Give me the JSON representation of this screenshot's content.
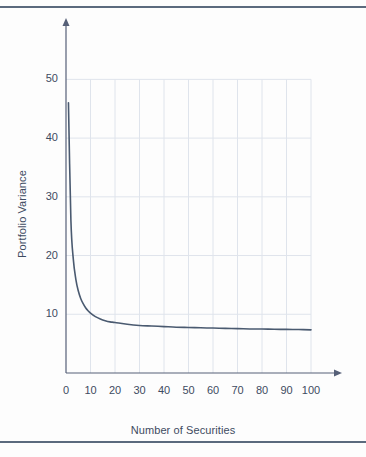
{
  "figure": {
    "background_color": "#fdfdfd",
    "rule_color": "#5b6a7d",
    "frame": {
      "top_rule": true,
      "bottom_rule": true
    }
  },
  "axes": {
    "x": {
      "title": "Number of Securities",
      "ticks": [
        "0",
        "10",
        "20",
        "30",
        "40",
        "50",
        "60",
        "70",
        "80",
        "90",
        "100"
      ],
      "range": [
        0,
        100
      ],
      "arrow": true
    },
    "y": {
      "title": "Portfolio Variance",
      "ticks": [
        "10",
        "20",
        "30",
        "40",
        "50"
      ],
      "range": [
        0,
        55
      ],
      "arrow": true
    }
  },
  "style": {
    "curve_color": "#4a5a70",
    "grid_color": "#dfe4ec",
    "axis_color": "#566078",
    "label_color": "#3d4b61"
  },
  "chart_data": {
    "type": "line",
    "title": "",
    "xlabel": "Number of Securities",
    "ylabel": "Portfolio Variance",
    "xlim": [
      0,
      100
    ],
    "ylim": [
      0,
      55
    ],
    "grid": true,
    "legend": "none",
    "x": [
      1,
      2,
      3,
      4,
      5,
      6,
      7,
      8,
      9,
      10,
      12,
      14,
      16,
      18,
      20,
      25,
      30,
      35,
      40,
      45,
      50,
      55,
      60,
      65,
      70,
      75,
      80,
      85,
      90,
      95,
      100
    ],
    "series": [
      {
        "name": "Portfolio Variance",
        "values": [
          46.0,
          26.0,
          19.3,
          16.0,
          14.0,
          12.7,
          11.8,
          11.1,
          10.6,
          10.2,
          9.6,
          9.2,
          8.9,
          8.7,
          8.6,
          8.3,
          8.1,
          8.0,
          7.9,
          7.8,
          7.75,
          7.7,
          7.65,
          7.6,
          7.55,
          7.5,
          7.48,
          7.45,
          7.42,
          7.4,
          7.35
        ]
      }
    ],
    "annotations": [
      "Diversification reduces portfolio variance sharply up to about 10-15 securities, then flattens toward a systematic-risk floor near 7.3"
    ]
  }
}
